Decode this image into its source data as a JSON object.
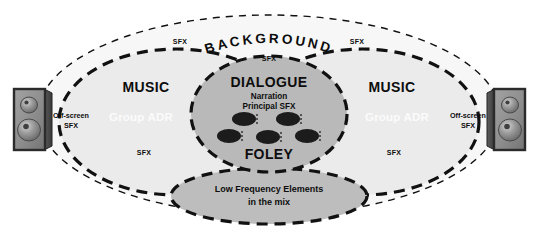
{
  "diagram": {
    "colors": {
      "page_background": "#ffffff",
      "background_zone_fill": "#f7f7f7",
      "music_zone_fill": "#ebebeb",
      "dialogue_zone_fill": "#b9b9b9",
      "lfe_zone_fill": "#bdbdbd",
      "stroke_dark": "#111111",
      "head_fill": "#1c1c1c",
      "speaker_body": "#8a8a8a",
      "speaker_border": "#2b2b2b",
      "text_dark": "#0d0d0d",
      "text_white": "#fbfbfb"
    },
    "zones": {
      "background": {
        "label": "BACKGROUND",
        "sfx_left": "SFX",
        "sfx_right": "SFX",
        "sfx_center": "SFX"
      },
      "music_left": {
        "label": "MUSIC",
        "group_adr": "Group ADR",
        "sfx": "SFX",
        "off_screen_line1": "Off-screen",
        "off_screen_line2": "SFX"
      },
      "music_right": {
        "label": "MUSIC",
        "group_adr": "Group ADR",
        "sfx": "SFX",
        "off_screen_line1": "Off-screen",
        "off_screen_line2": "SFX"
      },
      "dialogue": {
        "label": "DIALOGUE",
        "sub_line1": "Narration",
        "sub_line2": "Principal SFX",
        "foley_label": "FOLEY",
        "head_count": 5
      },
      "lfe": {
        "line1": "Low Frequency Elements",
        "line2": "in the mix"
      }
    },
    "speakers": {
      "left": {
        "name": "Left monitor speaker"
      },
      "right": {
        "name": "Right monitor speaker"
      }
    }
  }
}
